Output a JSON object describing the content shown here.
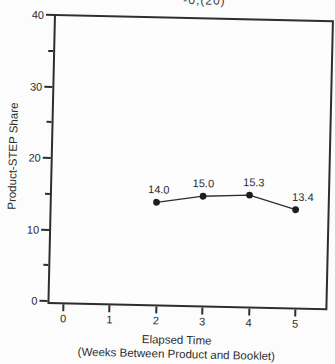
{
  "figure": {
    "clipped_title_fragment": "-0,(20)",
    "background": "#fcfcfc",
    "ink_color": "#2d2d2d"
  },
  "chart_data": {
    "type": "line",
    "title": "",
    "x": [
      2,
      3,
      4,
      5
    ],
    "values": [
      14.0,
      15.0,
      15.3,
      13.4
    ],
    "point_labels": [
      "14.0",
      "15.0",
      "15.3",
      "13.4"
    ],
    "xlabel": "Elapsed Time",
    "xlabel_sub": "(Weeks Between Product and Booklet)",
    "ylabel": "Product-STEP Share",
    "x_ticks": [
      0,
      1,
      2,
      3,
      4,
      5
    ],
    "y_ticks": [
      0,
      10,
      20,
      30,
      40
    ],
    "y_minor_ticks": [
      5,
      15,
      25,
      35
    ],
    "xlim": [
      0,
      5
    ],
    "ylim": [
      0,
      40
    ],
    "grid": "off",
    "legend": "none",
    "line_color": "#2d2d2d",
    "marker": "filled-circle"
  }
}
